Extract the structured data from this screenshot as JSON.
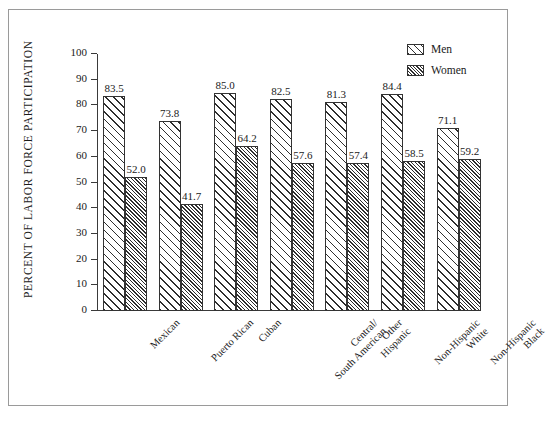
{
  "frame": {
    "border_color": "#9a9a9a"
  },
  "chart_data": {
    "type": "bar",
    "title": "",
    "subtitle": "",
    "xlabel": "",
    "ylabel": "PERCENT OF LABOR FORCE PARTICIPATION",
    "ylim": [
      0,
      100
    ],
    "yticks": [
      0,
      10,
      20,
      30,
      40,
      50,
      60,
      70,
      80,
      90,
      100
    ],
    "grid": false,
    "legend_position": "top-right",
    "categories": [
      "Mexican",
      "Puerto Rican",
      "Cuban",
      "Central/ South American",
      "Other Hispanic",
      "Non-Hispanic White",
      "Non-Hispanic Black"
    ],
    "category_lines": [
      [
        "Mexican",
        ""
      ],
      [
        "Puerto Rican",
        ""
      ],
      [
        "Cuban",
        ""
      ],
      [
        "Central/",
        "South American"
      ],
      [
        "Other",
        "Hispanic"
      ],
      [
        "Non-Hispanic",
        "White"
      ],
      [
        "Non-Hispanic",
        "Black"
      ]
    ],
    "series": [
      {
        "name": "Men",
        "pattern": "wide-diagonal-hatch",
        "values": [
          83.5,
          73.8,
          85.0,
          82.5,
          81.3,
          84.4,
          71.1
        ],
        "labels": [
          "83.5",
          "73.8",
          "85.0",
          "82.5",
          "81.3",
          "84.4",
          "71.1"
        ]
      },
      {
        "name": "Women",
        "pattern": "dense-diagonal-hatch",
        "values": [
          52.0,
          41.7,
          64.2,
          57.6,
          57.4,
          58.5,
          59.2
        ],
        "labels": [
          "52.0",
          "41.7",
          "64.2",
          "57.6",
          "57.4",
          "58.5",
          "59.2"
        ]
      }
    ],
    "colors": {
      "bar_outline": "#333333",
      "hatch": "#2e2e2e",
      "bar_fill": "#ffffff",
      "axis": "#3a3a3a",
      "text": "#1a1a1a"
    }
  },
  "legend": {
    "items": [
      {
        "label": "Men"
      },
      {
        "label": "Women"
      }
    ]
  }
}
